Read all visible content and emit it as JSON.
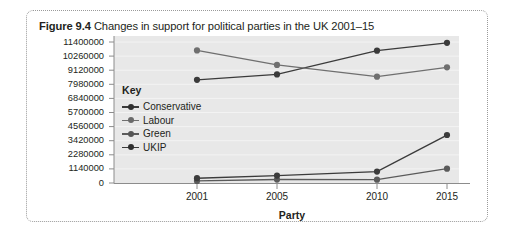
{
  "figure": {
    "label": "Figure 9.4",
    "caption": "Changes in support for political parties in the UK 2001–15"
  },
  "legend": {
    "title": "Key",
    "entries": [
      {
        "label": "Conservative",
        "color": "#3b3b3b"
      },
      {
        "label": "Labour",
        "color": "#6f6f6f"
      },
      {
        "label": "Green",
        "color": "#5a5a5a"
      },
      {
        "label": "UKIP",
        "color": "#3b3b3b"
      }
    ]
  },
  "chart_data": {
    "type": "line",
    "title": "Changes in support for political parties in the UK 2001–15",
    "xlabel": "Party",
    "ylabel": "",
    "categories": [
      "2001",
      "2005",
      "2010",
      "2015"
    ],
    "x": [
      2001,
      2005,
      2010,
      2015
    ],
    "ylim": [
      0,
      11400000
    ],
    "ytick_interval": 1140000,
    "yticks": [
      "0",
      "1140000",
      "2280000",
      "3420000",
      "4560000",
      "5700000",
      "6840000",
      "7980000",
      "9120000",
      "10260000",
      "11400000"
    ],
    "ytick_values": [
      0,
      1140000,
      2280000,
      3420000,
      4560000,
      5700000,
      6840000,
      7980000,
      9120000,
      10260000,
      11400000
    ],
    "grid": true,
    "legend_position": "inside-left",
    "plot_background": "#e8e8e8",
    "series": [
      {
        "name": "Conservative",
        "color": "#3b3b3b",
        "values": [
          8340000,
          8780000,
          10700000,
          11330000
        ]
      },
      {
        "name": "Labour",
        "color": "#6f6f6f",
        "values": [
          10720000,
          9550000,
          8600000,
          9350000
        ]
      },
      {
        "name": "Green",
        "color": "#5a5a5a",
        "values": [
          170000,
          280000,
          270000,
          1160000
        ]
      },
      {
        "name": "UKIP",
        "color": "#3b3b3b",
        "values": [
          390000,
          600000,
          920000,
          3880000
        ]
      }
    ]
  }
}
